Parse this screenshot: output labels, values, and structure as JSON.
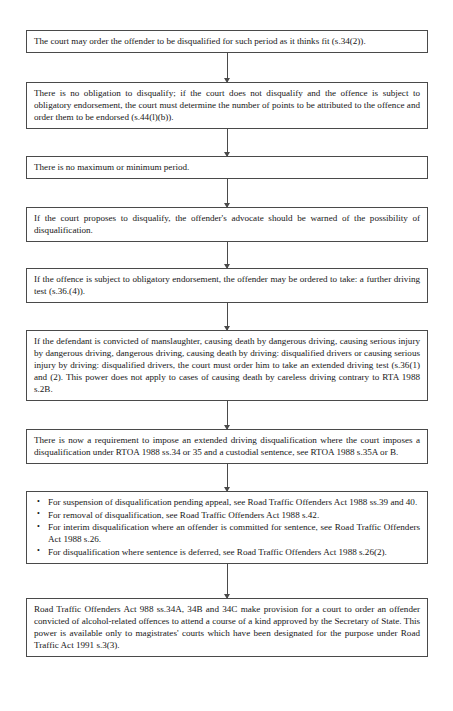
{
  "document": {
    "type": "flowchart",
    "title": "Disqualification flowchart",
    "orientation": "vertical",
    "connector_style": "line-with-down-arrow"
  },
  "nodes": [
    {
      "id": "node-1",
      "kind": "paragraph",
      "text": "The court may order the offender to be disqualified for such period as it thinks fit (s.34(2))."
    },
    {
      "id": "node-2",
      "kind": "paragraph",
      "text": "There is no obligation to disqualify; if the court does not disqualify and the offence is subject to obligatory endorsement, the court must determine the number of points to be attributed to the offence and order them to be endorsed (s.44(l)(b))."
    },
    {
      "id": "node-3",
      "kind": "paragraph",
      "text": "There is no maximum or minimum period."
    },
    {
      "id": "node-4",
      "kind": "paragraph",
      "text": "If the court proposes to disqualify, the offender's advocate should be warned of the possibility of disqualification."
    },
    {
      "id": "node-5",
      "kind": "paragraph",
      "text": "If the offence is subject to obligatory endorsement, the offender may be ordered to take: a further driving test (s.36.(4))."
    },
    {
      "id": "node-6",
      "kind": "paragraph",
      "text": "If the defendant is convicted of manslaughter, causing death by dangerous driving, causing serious injury by dangerous driving, dangerous driving, causing death by driving: disqualified drivers or causing serious injury by driving: disqualified drivers, the court must order him to take an extended driving test (s.36(1) and (2). This power does not apply to cases of causing death by careless driving contrary to RTA 1988 s.2B."
    },
    {
      "id": "node-7",
      "kind": "paragraph",
      "text": "There is now a requirement to impose an extended driving disqualification where the court imposes a disqualification under RTOA 1988 ss.34 or 35 and a custodial sentence, see RTOA 1988 s.35A or B."
    },
    {
      "id": "node-8",
      "kind": "list",
      "bullet": "•",
      "items": [
        "For suspension of disqualification pending appeal, see Road Traffic Offenders Act 1988 ss.39 and 40.",
        "For removal of disqualification, see Road Traffic Offenders Act 1988 s.42.",
        "For interim disqualification where an offender is committed for sentence, see Road Traffic Offenders Act 1988 s.26.",
        "For disqualification where sentence is deferred, see Road Traffic Offenders Act 1988 s.26(2)."
      ]
    },
    {
      "id": "node-9",
      "kind": "paragraph",
      "text": "Road Traffic Offenders Act 988 ss.34A, 34B and 34C make provision for a court to order an offender convicted of alcohol-related offences to attend a course of a kind approved by the Secretary of State. This power is available only to magistrates' courts which have been designated for the purpose under Road Traffic Act 1991 s.3(3)."
    }
  ],
  "colors": {
    "page_background": "#ffffff",
    "box_border": "#4a4a4a",
    "box_background": "#ffffff",
    "text": "#161616",
    "connector": "#4a4a4a"
  }
}
